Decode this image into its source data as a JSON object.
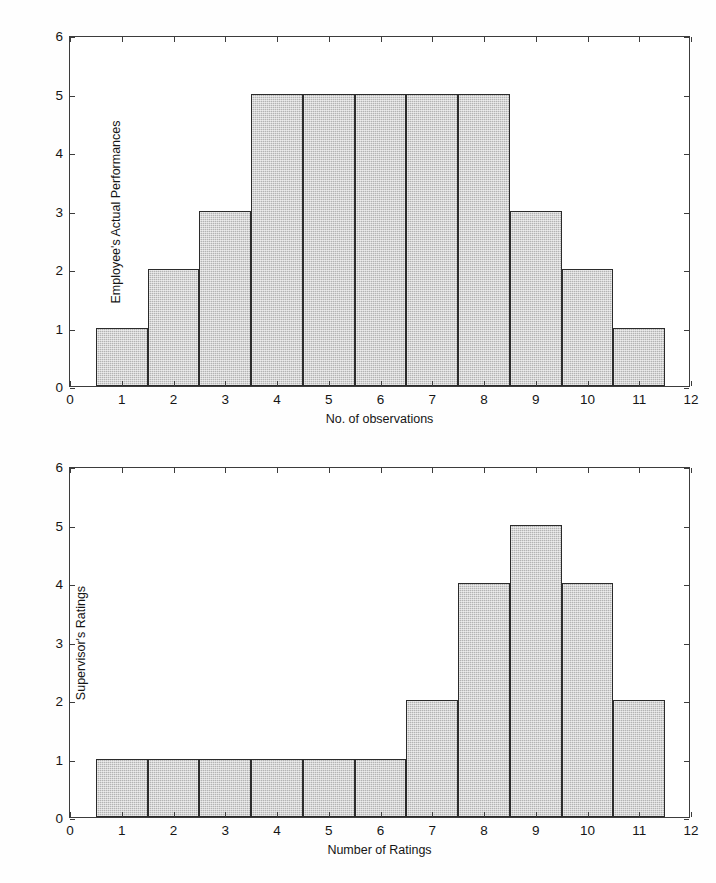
{
  "document": {
    "type": "scanned-figure-page",
    "cropped_header_text": "",
    "background_color": "#fefefe",
    "ink_color": "#1a1a1a"
  },
  "style": {
    "bar_fill": "#b3b3b3",
    "bar_edge": "#2b2b2b",
    "axis_color": "#3c3c3c"
  },
  "chart_data": [
    {
      "id": "employee-actual-performances-histogram",
      "type": "bar",
      "title": "",
      "xlabel": "No. of observations",
      "ylabel": "Employee's Actual Performances",
      "categories": [
        1,
        2,
        3,
        4,
        5,
        6,
        7,
        8,
        9,
        10,
        11
      ],
      "values": [
        1,
        2,
        3,
        5,
        5,
        5,
        5,
        5,
        3,
        2,
        1
      ],
      "xlim": [
        0,
        12
      ],
      "ylim": [
        0,
        6
      ],
      "xticks": [
        0,
        1,
        2,
        3,
        4,
        5,
        6,
        7,
        8,
        9,
        10,
        11,
        12
      ],
      "yticks": [
        0,
        1,
        2,
        3,
        4,
        5,
        6
      ],
      "xtick_labels": [
        "0",
        "1",
        "2",
        "3",
        "4",
        "5",
        "6",
        "7",
        "8",
        "9",
        "10",
        "11",
        "12"
      ],
      "ytick_labels": [
        "0",
        "1",
        "2",
        "3",
        "4",
        "5",
        "6"
      ],
      "bar_width": 1,
      "grid": false,
      "legend": false,
      "box": true
    },
    {
      "id": "supervisors-ratings-histogram",
      "type": "bar",
      "title": "",
      "xlabel": "Number of Ratings",
      "ylabel": "Supervisor's Ratings",
      "categories": [
        1,
        2,
        3,
        4,
        5,
        6,
        7,
        8,
        9,
        10,
        11
      ],
      "values": [
        1,
        1,
        1,
        1,
        1,
        1,
        2,
        4,
        5,
        4,
        2
      ],
      "xlim": [
        0,
        12
      ],
      "ylim": [
        0,
        6
      ],
      "xticks": [
        0,
        1,
        2,
        3,
        4,
        5,
        6,
        7,
        8,
        9,
        10,
        11,
        12
      ],
      "yticks": [
        0,
        1,
        2,
        3,
        4,
        5,
        6
      ],
      "xtick_labels": [
        "0",
        "1",
        "2",
        "3",
        "4",
        "5",
        "6",
        "7",
        "8",
        "9",
        "10",
        "11",
        "12"
      ],
      "ytick_labels": [
        "0",
        "1",
        "2",
        "3",
        "4",
        "5",
        "6"
      ],
      "bar_width": 1,
      "grid": false,
      "legend": false,
      "box": true
    }
  ]
}
